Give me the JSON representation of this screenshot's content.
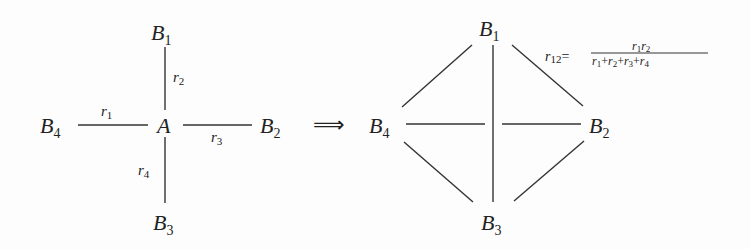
{
  "left_diagram": {
    "center": "A",
    "nodes": [
      {
        "name": "B",
        "sub": "1"
      },
      {
        "name": "B",
        "sub": "2"
      },
      {
        "name": "B",
        "sub": "3"
      },
      {
        "name": "B",
        "sub": "4"
      }
    ],
    "resistors": [
      {
        "name": "r",
        "sub": "1"
      },
      {
        "name": "r",
        "sub": "2"
      },
      {
        "name": "r",
        "sub": "3"
      },
      {
        "name": "r",
        "sub": "4"
      }
    ]
  },
  "arrow": "⟹",
  "right_diagram": {
    "nodes": [
      {
        "name": "B",
        "sub": "1"
      },
      {
        "name": "B",
        "sub": "2"
      },
      {
        "name": "B",
        "sub": "3"
      },
      {
        "name": "B",
        "sub": "4"
      }
    ],
    "formula": {
      "lhs_name": "r",
      "lhs_sub": "12",
      "eq": "=",
      "num": [
        {
          "name": "r",
          "sub": "1"
        },
        {
          "name": "r",
          "sub": "2"
        }
      ],
      "den": [
        {
          "name": "r",
          "sub": "1"
        },
        {
          "op": "+"
        },
        {
          "name": "r",
          "sub": "2"
        },
        {
          "op": "+"
        },
        {
          "name": "r",
          "sub": "3"
        },
        {
          "op": "+"
        },
        {
          "name": "r",
          "sub": "4"
        }
      ]
    }
  }
}
